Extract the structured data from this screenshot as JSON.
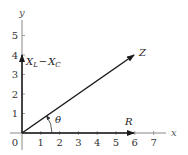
{
  "diagram": {
    "type": "phasor-impedance-diagram",
    "axes": {
      "x_label": "x",
      "y_label": "y",
      "origin_label": "0",
      "x_ticks": [
        "1",
        "2",
        "3",
        "4",
        "5",
        "6",
        "7"
      ],
      "y_ticks": [
        "1",
        "2",
        "3",
        "4",
        "5"
      ]
    },
    "vectors": {
      "z": {
        "label": "Z",
        "end": [
          6,
          4
        ]
      },
      "r": {
        "label": "R",
        "end": [
          6,
          0
        ]
      },
      "x": {
        "label_main_1": "X",
        "label_sub_1": "L",
        "label_minus": "−",
        "label_main_2": "X",
        "label_sub_2": "C",
        "end": [
          0,
          4
        ]
      }
    },
    "angle": {
      "label": "θ"
    },
    "colors": {
      "axis": "#888888",
      "vector": "#1a1a1a",
      "background": "#ffffff"
    }
  }
}
